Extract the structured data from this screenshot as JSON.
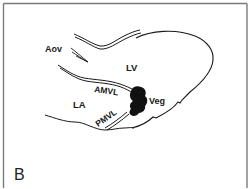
{
  "figure": {
    "panel_label": "B",
    "labels": {
      "aov": "Aov",
      "lv": "LV",
      "amvl": "AMVL",
      "veg": "Veg",
      "la": "LA",
      "pmvl": "PMVL"
    },
    "colors": {
      "ink": "#1a1a1a",
      "frame": "#7a7a7a",
      "background": "#ffffff"
    }
  }
}
